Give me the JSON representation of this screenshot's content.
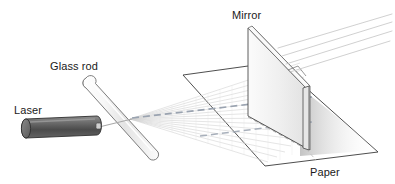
{
  "figure": {
    "background_color": "#ffffff",
    "width": 395,
    "height": 184
  },
  "labels": {
    "laser": "Laser",
    "glass_rod": "Glass rod",
    "mirror": "Mirror",
    "paper": "Paper"
  },
  "colors": {
    "outline": "#2b2b2b",
    "laser_body_dark": "#4a4a4a",
    "laser_body_light": "#8d8d8d",
    "laser_cap": "#6f6f6f",
    "glass_rod_fill": "#f2f2f2",
    "glass_rod_edge": "#6e6e6e",
    "mirror_face": "#ededed",
    "mirror_edge": "#555555",
    "paper_fill": "#ffffff",
    "paper_edge": "#3a3a3a",
    "ray_light": "#c9c9c9",
    "dashed_ray": "#9aa3b0",
    "shadow": "#d8d8d8"
  },
  "elements": {
    "laser": {
      "name": "laser-pointer",
      "shape": "cylinder",
      "from": [
        22,
        132
      ],
      "to": [
        100,
        122
      ]
    },
    "glass_rod": {
      "name": "glass-rod",
      "shape": "tilted-cylinder",
      "top": [
        86,
        78
      ],
      "bottom": [
        154,
        156
      ]
    },
    "incident_beam": {
      "name": "incident-beam",
      "from": [
        100,
        126
      ],
      "to": [
        128,
        120
      ]
    },
    "fan_rays": {
      "name": "diverging-ray-fan",
      "origin": [
        128,
        120
      ],
      "count": 16
    },
    "center_dashed_ray": {
      "name": "center-axis-dashed-ray",
      "from": [
        132,
        118
      ],
      "to": [
        312,
        97
      ]
    },
    "mirror": {
      "name": "mirror-panel",
      "top_left": [
        248,
        28
      ],
      "top_right": [
        306,
        88
      ],
      "bottom_right": [
        306,
        148
      ],
      "bottom_left": [
        248,
        116
      ]
    },
    "paper": {
      "name": "paper-sheet",
      "corners": [
        [
          183,
          75
        ],
        [
          277,
          62
        ],
        [
          378,
          152
        ],
        [
          265,
          166
        ]
      ]
    },
    "reflected_rays": {
      "name": "reflected-rays",
      "count": 4
    }
  }
}
